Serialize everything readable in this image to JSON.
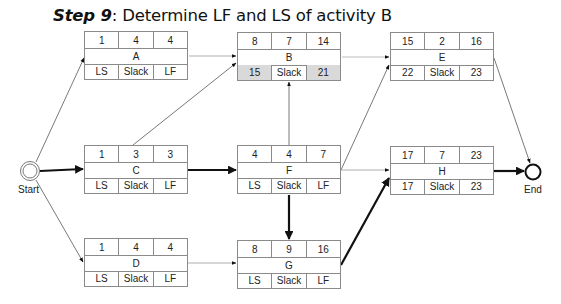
{
  "title": {
    "step": "Step 9",
    "text": ": Determine LF and LS of activity B"
  },
  "highlight_color": "#d9d9d9",
  "events": {
    "start": "Start",
    "end": "End"
  },
  "nodes": {
    "A": {
      "es": "1",
      "dur": "4",
      "ef": "4",
      "name": "A",
      "ls": "LS",
      "slack": "Slack",
      "lf": "LF"
    },
    "B": {
      "es": "8",
      "dur": "7",
      "ef": "14",
      "name": "B",
      "ls": "15",
      "slack": "Slack",
      "lf": "21"
    },
    "C": {
      "es": "1",
      "dur": "3",
      "ef": "3",
      "name": "C",
      "ls": "LS",
      "slack": "Slack",
      "lf": "LF"
    },
    "D": {
      "es": "1",
      "dur": "4",
      "ef": "4",
      "name": "D",
      "ls": "LS",
      "slack": "Slack",
      "lf": "LF"
    },
    "E": {
      "es": "15",
      "dur": "2",
      "ef": "16",
      "name": "E",
      "ls": "22",
      "slack": "Slack",
      "lf": "23"
    },
    "F": {
      "es": "4",
      "dur": "4",
      "ef": "7",
      "name": "F",
      "ls": "LS",
      "slack": "Slack",
      "lf": "LF"
    },
    "G": {
      "es": "8",
      "dur": "9",
      "ef": "16",
      "name": "G",
      "ls": "LS",
      "slack": "Slack",
      "lf": "LF"
    },
    "H": {
      "es": "17",
      "dur": "7",
      "ef": "23",
      "name": "H",
      "ls": "17",
      "slack": "Slack",
      "lf": "23"
    }
  },
  "edges": [
    {
      "from": "Start",
      "to": "A",
      "critical": false
    },
    {
      "from": "Start",
      "to": "C",
      "critical": true
    },
    {
      "from": "Start",
      "to": "D",
      "critical": false
    },
    {
      "from": "A",
      "to": "B",
      "critical": false
    },
    {
      "from": "C",
      "to": "B",
      "critical": false
    },
    {
      "from": "C",
      "to": "F",
      "critical": true
    },
    {
      "from": "D",
      "to": "G",
      "critical": false
    },
    {
      "from": "F",
      "to": "B",
      "critical": false
    },
    {
      "from": "F",
      "to": "E",
      "critical": false
    },
    {
      "from": "F",
      "to": "H",
      "critical": false
    },
    {
      "from": "F",
      "to": "G",
      "critical": true
    },
    {
      "from": "B",
      "to": "E",
      "critical": false
    },
    {
      "from": "G",
      "to": "H",
      "critical": true
    },
    {
      "from": "E",
      "to": "End",
      "critical": false
    },
    {
      "from": "H",
      "to": "End",
      "critical": true
    }
  ]
}
